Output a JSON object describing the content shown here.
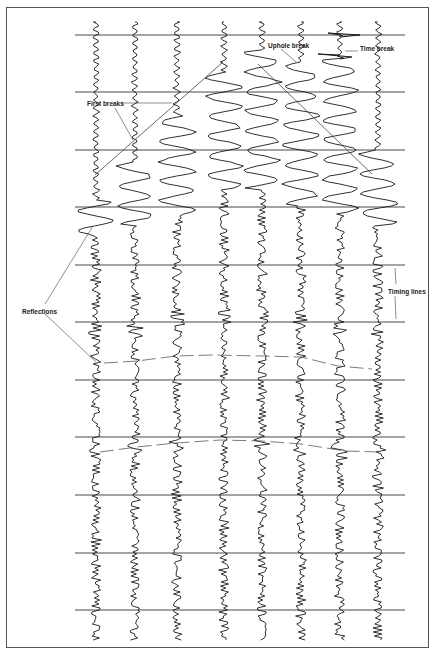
{
  "figure": {
    "colors": {
      "trace": "#1a1a1a",
      "timing_line": "#333333",
      "annotation": "#444444",
      "frame": "#555555",
      "background": "#ffffff"
    }
  },
  "labels": {
    "uphole_break": "Uphole break",
    "time_break": "Time break",
    "first_breaks": "First breaks",
    "reflections": "Reflections",
    "timing_lines": "Timing lines"
  },
  "layout": {
    "timing_lines_y": [
      35,
      92,
      150,
      207,
      265,
      322,
      380,
      437,
      495,
      553,
      610
    ],
    "timing_line_x_range": [
      75,
      405
    ],
    "trace_x": [
      96,
      135,
      177,
      224,
      262,
      301,
      340,
      378
    ],
    "trace_y_range": [
      22,
      640
    ]
  }
}
